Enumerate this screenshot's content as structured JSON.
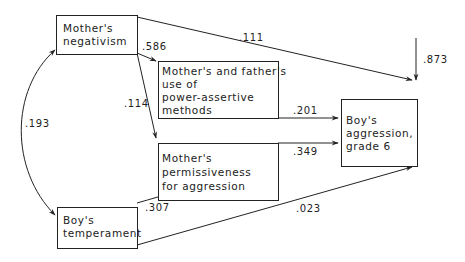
{
  "diagram": {
    "type": "path-diagram",
    "nodes": {
      "mother_negativism": {
        "lines": [
          "Mother's",
          "negativism"
        ]
      },
      "power_assertive": {
        "lines": [
          "Mother's and father's",
          "use of",
          "power-assertive",
          "methods"
        ]
      },
      "permissiveness": {
        "lines": [
          "Mother's",
          "permissiveness",
          "for aggression"
        ]
      },
      "boy_temperament": {
        "lines": [
          "Boy's",
          "temperament"
        ]
      },
      "boy_aggression": {
        "lines": [
          "Boy's",
          "aggression,",
          "grade 6"
        ]
      }
    },
    "coefficients": {
      "negativism_to_aggression": ".111",
      "negativism_to_power": ".586",
      "negativism_to_permissiveness": ".114",
      "negativism_temperament_correlation": ".193",
      "power_to_aggression": ".201",
      "permissiveness_to_aggression": ".349",
      "temperament_to_permissiveness": ".307",
      "temperament_to_aggression": ".023",
      "residual_aggression": ".873"
    },
    "line_color": "#222222"
  }
}
